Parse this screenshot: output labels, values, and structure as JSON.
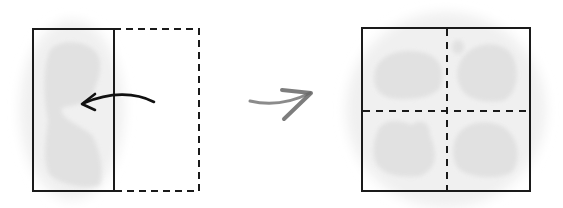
{
  "diagram": {
    "colors": {
      "stroke": "#1a1a1a",
      "smudge": "#d6d6d6",
      "halo": "#efefef",
      "transition_arrow": "#777777"
    },
    "left_panel": {
      "label": "folded-rectangle",
      "solid_rect": {
        "x": 33,
        "y": 29,
        "w": 81,
        "h": 162
      },
      "dashed_rect": {
        "x": 114,
        "y": 29,
        "w": 85,
        "h": 162
      },
      "fold_arrow": "curved-arrow-pointing-left"
    },
    "transition": {
      "label": "right-arrow"
    },
    "right_panel": {
      "label": "unfolded-square",
      "square": {
        "x": 362,
        "y": 28,
        "w": 168,
        "h": 163
      },
      "quadrants": 4
    }
  }
}
